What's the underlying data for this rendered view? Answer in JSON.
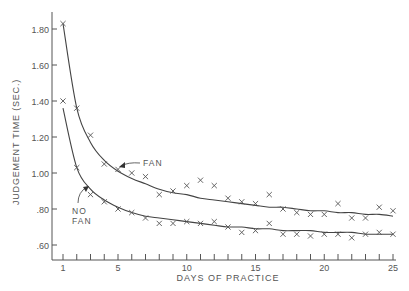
{
  "chart_data": {
    "type": "scatter",
    "title": "",
    "xlabel": "DAYS OF PRACTICE",
    "ylabel": "JUDGEMENT TIME (SEC.)",
    "xlim": [
      0.2,
      25.5
    ],
    "ylim": [
      0.51,
      1.9
    ],
    "grid": false,
    "legend": "none (inline curve labels with arrows)",
    "x_ticks": [
      1,
      5,
      10,
      15,
      20,
      25
    ],
    "x_tick_labels": [
      "1",
      "5",
      "10",
      "15",
      "20",
      "25"
    ],
    "y_ticks": [
      0.6,
      0.8,
      1.0,
      1.2,
      1.4,
      1.6,
      1.8
    ],
    "y_tick_labels": [
      ".60",
      ".80",
      "1.00",
      "1.20",
      "1.40",
      "1.60",
      "1.80"
    ],
    "x": [
      1,
      2,
      3,
      4,
      5,
      6,
      7,
      8,
      9,
      10,
      11,
      12,
      13,
      14,
      15,
      16,
      17,
      18,
      19,
      20,
      21,
      22,
      23,
      24,
      25
    ],
    "series": [
      {
        "name": "FAN",
        "marker": "x",
        "fit": "smooth decreasing power curve",
        "values": [
          1.83,
          1.36,
          1.21,
          1.05,
          1.02,
          1.0,
          0.98,
          0.88,
          0.9,
          0.93,
          0.96,
          0.93,
          0.86,
          0.84,
          0.83,
          0.88,
          0.8,
          0.78,
          0.77,
          0.77,
          0.83,
          0.75,
          0.75,
          0.81,
          0.79
        ],
        "curve": [
          1.83,
          1.36,
          1.17,
          1.07,
          1.01,
          0.97,
          0.94,
          0.91,
          0.89,
          0.88,
          0.86,
          0.85,
          0.84,
          0.83,
          0.82,
          0.81,
          0.81,
          0.8,
          0.79,
          0.79,
          0.78,
          0.78,
          0.77,
          0.77,
          0.76
        ]
      },
      {
        "name": "NO FAN",
        "marker": "x",
        "fit": "smooth decreasing power curve",
        "values": [
          1.4,
          1.03,
          0.88,
          0.84,
          0.8,
          0.78,
          0.75,
          0.72,
          0.72,
          0.73,
          0.72,
          0.73,
          0.7,
          0.67,
          0.68,
          0.72,
          0.66,
          0.66,
          0.65,
          0.66,
          0.66,
          0.64,
          0.66,
          0.67,
          0.66
        ],
        "curve": [
          1.36,
          1.03,
          0.91,
          0.85,
          0.81,
          0.78,
          0.76,
          0.75,
          0.74,
          0.73,
          0.72,
          0.71,
          0.7,
          0.7,
          0.69,
          0.69,
          0.68,
          0.68,
          0.68,
          0.67,
          0.67,
          0.67,
          0.66,
          0.66,
          0.66
        ]
      }
    ],
    "annotations": [
      {
        "text": "FAN",
        "points_to": "FAN curve near day 5"
      },
      {
        "text": "NO FAN",
        "points_to": "NO FAN curve near day 3"
      }
    ]
  },
  "labels": {
    "xlabel": "DAYS OF PRACTICE",
    "ylabel": "JUDGEMENT TIME (SEC.)",
    "fan": "FAN",
    "no_fan_line1": "NO",
    "no_fan_line2": "FAN",
    "xt": [
      "1",
      "5",
      "10",
      "15",
      "20",
      "25"
    ],
    "yt": [
      ".60",
      ".80",
      "1.00",
      "1.20",
      "1.40",
      "1.60",
      "1.80"
    ]
  },
  "colors": {
    "ink": "#555555",
    "background": "#ffffff"
  }
}
